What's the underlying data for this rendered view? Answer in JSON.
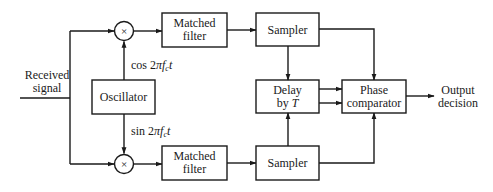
{
  "diagram": {
    "type": "block-diagram",
    "input": {
      "line1": "Received",
      "line2": "signal"
    },
    "oscillator": {
      "label": "Oscillator"
    },
    "carrier_labels": {
      "cos": {
        "prefix": "cos 2",
        "pi": "π",
        "f": "f",
        "sub": "c",
        "t": "t"
      },
      "sin": {
        "prefix": "sin 2",
        "pi": "π",
        "f": "f",
        "sub": "c",
        "t": "t"
      }
    },
    "multipliers": [
      {
        "symbol": "×",
        "branch": "top"
      },
      {
        "symbol": "×",
        "branch": "bottom"
      }
    ],
    "matched_filters": [
      {
        "line1": "Matched",
        "line2": "filter",
        "branch": "top"
      },
      {
        "line1": "Matched",
        "line2": "filter",
        "branch": "bottom"
      }
    ],
    "samplers": [
      {
        "label": "Sampler",
        "branch": "top"
      },
      {
        "label": "Sampler",
        "branch": "bottom"
      }
    ],
    "delay": {
      "line1": "Delay",
      "line2_prefix": "by ",
      "line2_var": "T"
    },
    "phase_comparator": {
      "line1": "Phase",
      "line2": "comparator"
    },
    "output": {
      "line1": "Output",
      "line2": "decision"
    },
    "colors": {
      "stroke": "#1a1a1a",
      "background": "#ffffff"
    }
  }
}
